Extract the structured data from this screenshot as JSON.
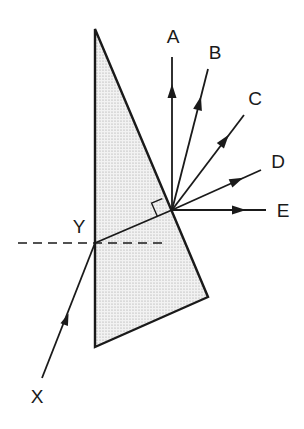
{
  "diagram": {
    "type": "prism-refraction",
    "colors": {
      "stroke": "#1a1a1a",
      "fill": "#e4e4e4",
      "background": "#ffffff"
    },
    "prism": {
      "vertices": [
        [
          95,
          29
        ],
        [
          208,
          297
        ],
        [
          95,
          347
        ]
      ]
    },
    "normal_line": {
      "from": [
        18,
        243
      ],
      "to": [
        166,
        243
      ],
      "style": "dashed"
    },
    "incident_ray": {
      "label": "X",
      "from": [
        42,
        378
      ],
      "to": [
        95,
        243
      ]
    },
    "incidence_point": {
      "label": "Y",
      "at": [
        95,
        243
      ]
    },
    "internal_ray": {
      "from": [
        95,
        243
      ],
      "to": [
        172,
        210
      ]
    },
    "right_angle_marker": true,
    "emergent_rays": [
      {
        "label": "A",
        "to": [
          172,
          57
        ]
      },
      {
        "label": "B",
        "to": [
          208,
          69
        ]
      },
      {
        "label": "C",
        "to": [
          244,
          115
        ]
      },
      {
        "label": "D",
        "to": [
          261,
          170
        ]
      },
      {
        "label": "E",
        "to": [
          266,
          210
        ]
      }
    ],
    "labels": {
      "A": "A",
      "B": "B",
      "C": "C",
      "D": "D",
      "E": "E",
      "X": "X",
      "Y": "Y"
    }
  }
}
